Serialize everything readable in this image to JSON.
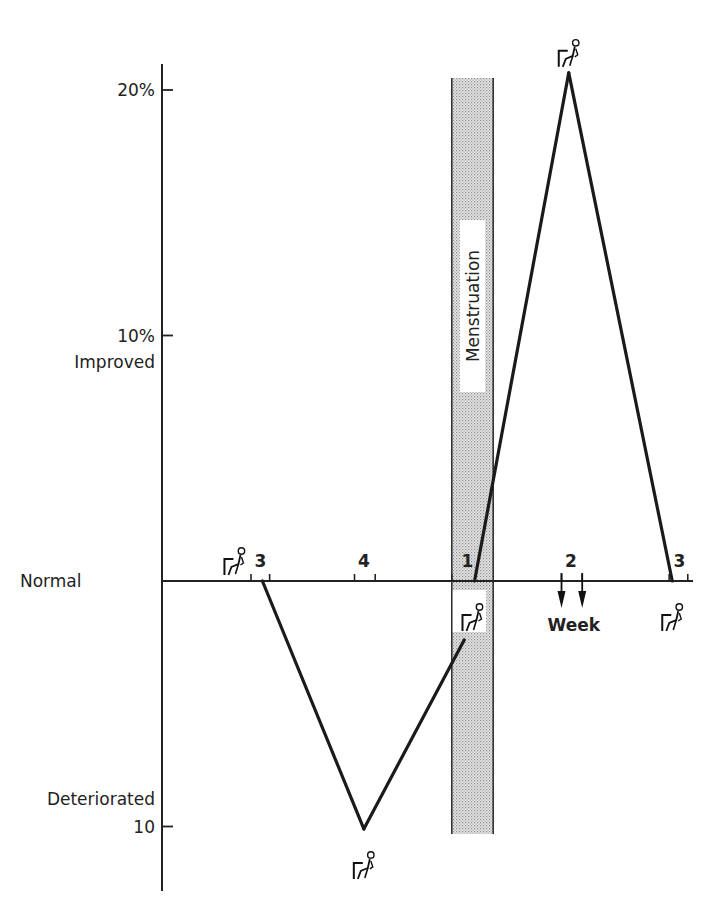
{
  "chart_data": {
    "type": "line",
    "title": "",
    "xlabel": "Week",
    "ylabel": "",
    "y_unit": "% change from normal",
    "ylim": [
      -10.5,
      21.5
    ],
    "y_ticks": [
      {
        "value": 20,
        "label": "20%"
      },
      {
        "value": 10,
        "label": "10%"
      },
      {
        "value": 0,
        "label": ""
      },
      {
        "value": -10,
        "label": "10"
      }
    ],
    "y_annotations": [
      {
        "value": 10,
        "label": "Improved",
        "position": "below-tick"
      },
      {
        "value": 0,
        "label": "Normal"
      },
      {
        "value": -10,
        "label": "Deteriorated",
        "position": "above-tick"
      }
    ],
    "x_range": [
      0,
      5.3
    ],
    "x_week_labels": [
      {
        "x": 0.95,
        "label": "3"
      },
      {
        "x": 1.95,
        "label": "4"
      },
      {
        "x": 2.95,
        "label": "1"
      },
      {
        "x": 3.95,
        "label": "2"
      },
      {
        "x": 5.0,
        "label": "3"
      }
    ],
    "x_ticks": [
      0.86,
      1.04,
      1.86,
      2.06,
      2.8,
      3.86,
      4.06,
      4.9,
      5.08
    ],
    "x_arrows": [
      3.86,
      4.06
    ],
    "series": [
      {
        "name": "Performance",
        "points": [
          {
            "x": 0.97,
            "y": 0
          },
          {
            "x": 1.95,
            "y": -10.1
          },
          {
            "x": 2.92,
            "y": -2.4
          }
        ]
      },
      {
        "name": "Performance (continued)",
        "points": [
          {
            "x": 3.02,
            "y": 0
          },
          {
            "x": 3.93,
            "y": 20.7
          },
          {
            "x": 4.93,
            "y": 0
          }
        ]
      }
    ],
    "shaded_band": {
      "label": "Menstruation",
      "x_start": 2.8,
      "x_end": 3.2
    },
    "markers": [
      {
        "name": "seated-figure",
        "x": 0.7,
        "y": 0,
        "side": "above"
      },
      {
        "name": "seated-figure",
        "x": 1.95,
        "y": -10.1,
        "side": "below"
      },
      {
        "name": "seated-figure",
        "x": 3.0,
        "y": 0,
        "side": "below"
      },
      {
        "name": "seated-figure",
        "x": 3.93,
        "y": 20.7,
        "side": "above"
      },
      {
        "name": "seated-figure",
        "x": 4.93,
        "y": 0,
        "side": "below"
      }
    ],
    "grid": false,
    "legend": "none"
  }
}
